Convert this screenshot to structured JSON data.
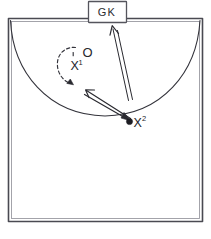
{
  "diagram": {
    "kind": "sports-play-diagram",
    "title": "",
    "background_color": "#ffffff",
    "ink_color": "#2a2a30",
    "court": {
      "name": "court-boundary",
      "shape": "rectangle",
      "crease": {
        "name": "crease-arc",
        "shape": "downward-semicircular-arc",
        "spans": "top-left-corner to top-right-corner"
      }
    },
    "goal": {
      "label": "GK",
      "role": "goalkeeper-box",
      "position": "top-center"
    },
    "players": [
      {
        "id": "x1",
        "label": "X",
        "superscript": "1",
        "role": "offense-cutter",
        "marker": "x-mark"
      },
      {
        "id": "o",
        "label": "O",
        "superscript": "",
        "role": "defender",
        "marker": "o-mark"
      },
      {
        "id": "x2",
        "label": "X",
        "superscript": "2",
        "role": "offense-ball-carrier",
        "marker": "x-mark"
      }
    ],
    "ball": {
      "name": "ball-marker",
      "style": "filled-dot",
      "held_by": "x2"
    },
    "movements": [
      {
        "id": "cut-path",
        "name": "cut-path-dashed-arrow",
        "style": "dashed-curve-with-arrowhead",
        "from": "x1",
        "to": "below-left-of-x1",
        "meaning": "player cut / dodge"
      },
      {
        "id": "pass-arrow",
        "name": "pass-arrow",
        "style": "solid-line-with-arrowhead",
        "from": "x2",
        "to": "x1-cut-area",
        "meaning": "pass"
      },
      {
        "id": "return-arrow",
        "name": "return-arrow",
        "style": "solid-line-with-arrowhead",
        "from": "x1-cut-area",
        "to": "x2",
        "meaning": "return / feed"
      },
      {
        "id": "shot-arrow",
        "name": "shot-arrow",
        "style": "double-line-with-arrowhead",
        "from": "x2",
        "to": "goal",
        "meaning": "shot on goal"
      }
    ]
  }
}
